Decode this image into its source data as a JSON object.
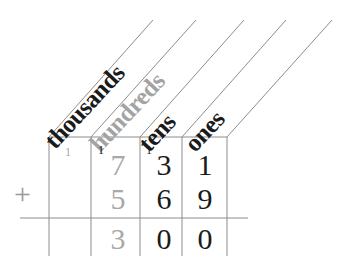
{
  "worksheet": {
    "title": "Column addition place-value grid",
    "operator": "+",
    "columns": [
      {
        "name": "thousands",
        "label": "thousands",
        "color": "#1a1a1a"
      },
      {
        "name": "hundreds",
        "label": "hundreds",
        "color": "#a3a3a3"
      },
      {
        "name": "tens",
        "label": "tens",
        "color": "#1a1a1a"
      },
      {
        "name": "ones",
        "label": "ones",
        "color": "#1a1a1a"
      }
    ],
    "carries": {
      "thousands": "1",
      "hundreds": "1",
      "tens": "1",
      "ones": ""
    },
    "rows": [
      {
        "name": "addend-1",
        "cells": [
          {
            "column": "thousands",
            "value": "",
            "tone": "light"
          },
          {
            "column": "hundreds",
            "value": "7",
            "tone": "light"
          },
          {
            "column": "tens",
            "value": "3",
            "tone": "dark"
          },
          {
            "column": "ones",
            "value": "1",
            "tone": "dark"
          }
        ]
      },
      {
        "name": "addend-2",
        "cells": [
          {
            "column": "thousands",
            "value": "",
            "tone": "light"
          },
          {
            "column": "hundreds",
            "value": "5",
            "tone": "light"
          },
          {
            "column": "tens",
            "value": "6",
            "tone": "dark"
          },
          {
            "column": "ones",
            "value": "9",
            "tone": "dark"
          }
        ]
      },
      {
        "name": "sum",
        "cells": [
          {
            "column": "thousands",
            "value": "",
            "tone": "light"
          },
          {
            "column": "hundreds",
            "value": "3",
            "tone": "light"
          },
          {
            "column": "tens",
            "value": "0",
            "tone": "dark"
          },
          {
            "column": "ones",
            "value": "0",
            "tone": "dark"
          }
        ]
      }
    ],
    "colors": {
      "background": "#ffffff",
      "rule": "#8c8c8c",
      "dark_ink": "#1a1a1a",
      "light_ink": "#a8a8a8"
    }
  }
}
